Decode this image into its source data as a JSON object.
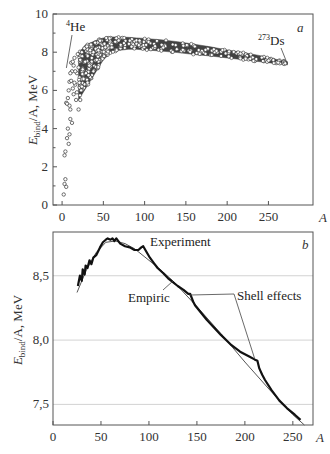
{
  "chart_data": [
    {
      "panel": "a",
      "type": "scatter",
      "xlabel": "A",
      "ylabel_main": "E",
      "ylabel_sub": "bind",
      "ylabel_rest": "/A, MeV",
      "xlim": [
        -11,
        304
      ],
      "ylim": [
        0,
        10
      ],
      "xticks": [
        0,
        50,
        100,
        150,
        200,
        250
      ],
      "xtick_labels": [
        "0",
        "50",
        "100",
        "150",
        "200",
        "250"
      ],
      "yticks": [
        0,
        2,
        4,
        6,
        8,
        10
      ],
      "ytick_labels": [
        "0",
        "2",
        "4",
        "6",
        "8",
        "10"
      ],
      "yminor": [
        1,
        3,
        5,
        7,
        9
      ],
      "grid": false,
      "low_points": [
        {
          "x": 2,
          "y": 0.55
        },
        {
          "x": 3,
          "y": 1.1
        },
        {
          "x": 4,
          "y": 1.35
        },
        {
          "x": 5,
          "y": 0.95
        },
        {
          "x": 3,
          "y": 2.6
        },
        {
          "x": 4,
          "y": 2.8
        },
        {
          "x": 6,
          "y": 3.5
        },
        {
          "x": 7,
          "y": 4.0
        },
        {
          "x": 8,
          "y": 3.2
        },
        {
          "x": 9,
          "y": 3.7
        },
        {
          "x": 5,
          "y": 5.35
        },
        {
          "x": 6,
          "y": 5.3
        },
        {
          "x": 7,
          "y": 5.6
        },
        {
          "x": 9,
          "y": 6.45
        },
        {
          "x": 10,
          "y": 5.0
        },
        {
          "x": 11,
          "y": 6.5
        },
        {
          "x": 11,
          "y": 7.45
        },
        {
          "x": 12,
          "y": 7.0
        },
        {
          "x": 13,
          "y": 7.5
        },
        {
          "x": 14,
          "y": 7.3
        },
        {
          "x": 15,
          "y": 7.7
        },
        {
          "x": 10,
          "y": 4.5
        },
        {
          "x": 12,
          "y": 4.3
        },
        {
          "x": 13,
          "y": 6.1
        },
        {
          "x": 14,
          "y": 5.8
        },
        {
          "x": 16,
          "y": 6.3
        },
        {
          "x": 17,
          "y": 5.5
        },
        {
          "x": 18,
          "y": 6.9
        },
        {
          "x": 19,
          "y": 7.9
        },
        {
          "x": 20,
          "y": 7.2
        },
        {
          "x": 20,
          "y": 5.0
        },
        {
          "x": 21,
          "y": 6.4
        },
        {
          "x": 22,
          "y": 7.6
        },
        {
          "x": 23,
          "y": 6.0
        },
        {
          "x": 24,
          "y": 8.0
        },
        {
          "x": 25,
          "y": 7.1
        },
        {
          "x": 26,
          "y": 6.6
        },
        {
          "x": 27,
          "y": 8.2
        },
        {
          "x": 28,
          "y": 7.5
        },
        {
          "x": 29,
          "y": 6.9
        },
        {
          "x": 30,
          "y": 8.3
        },
        {
          "x": 31,
          "y": 7.8
        },
        {
          "x": 33,
          "y": 7.3
        },
        {
          "x": 35,
          "y": 8.4
        },
        {
          "x": 36,
          "y": 7.7
        },
        {
          "x": 38,
          "y": 8.0
        },
        {
          "x": 40,
          "y": 8.5
        },
        {
          "x": 42,
          "y": 7.6
        },
        {
          "x": 44,
          "y": 8.1
        },
        {
          "x": 46,
          "y": 8.6
        },
        {
          "x": 8,
          "y": 6.0
        },
        {
          "x": 9,
          "y": 5.2
        },
        {
          "x": 10,
          "y": 6.9
        },
        {
          "x": 15,
          "y": 6.4
        },
        {
          "x": 16,
          "y": 7.0
        },
        {
          "x": 18,
          "y": 5.9
        },
        {
          "x": 22,
          "y": 5.5
        },
        {
          "x": 24,
          "y": 6.2
        },
        {
          "x": 32,
          "y": 6.8
        },
        {
          "x": 34,
          "y": 8.1
        }
      ],
      "band": {
        "description": "dense cloud of nuclides",
        "A": [
          20,
          30,
          40,
          50,
          60,
          70,
          80,
          90,
          100,
          120,
          140,
          160,
          180,
          200,
          220,
          240,
          260,
          273
        ],
        "upper": [
          8.0,
          8.4,
          8.6,
          8.75,
          8.8,
          8.79,
          8.78,
          8.75,
          8.72,
          8.65,
          8.55,
          8.42,
          8.28,
          8.12,
          7.98,
          7.82,
          7.62,
          7.5
        ],
        "lower": [
          5.5,
          6.2,
          6.9,
          7.6,
          8.0,
          8.1,
          8.15,
          8.15,
          8.12,
          8.06,
          7.98,
          7.88,
          7.8,
          7.7,
          7.6,
          7.5,
          7.4,
          7.33
        ]
      },
      "annotations": [
        {
          "text_sup": "4",
          "text": "He",
          "point": {
            "x": 4,
            "y": 7.07
          }
        },
        {
          "text_sup": "273",
          "text": "Ds",
          "point": {
            "x": 273,
            "y": 7.33
          }
        }
      ]
    },
    {
      "panel": "b",
      "type": "line",
      "xlabel": "A",
      "ylabel_main": "E",
      "ylabel_sub": "bind",
      "ylabel_rest": "/A, MeV",
      "xlim": [
        0,
        271
      ],
      "ylim": [
        7.34,
        8.84
      ],
      "xticks": [
        0,
        50,
        100,
        150,
        200,
        250
      ],
      "xtick_labels": [
        "0",
        "50",
        "100",
        "150",
        "200",
        "250"
      ],
      "yticks": [
        7.5,
        8.0,
        8.5
      ],
      "ytick_labels": [
        "7,5",
        "8,0",
        "8,5"
      ],
      "grid": true,
      "series": [
        {
          "name": "Experiment",
          "x": [
            26,
            28,
            30,
            31,
            33,
            34,
            36,
            38,
            40,
            42,
            45,
            49,
            52,
            55,
            57,
            60,
            62,
            64,
            66,
            70,
            75,
            80,
            85,
            89,
            92,
            94,
            97,
            101,
            105,
            109,
            115,
            120,
            125,
            130,
            136,
            141,
            143,
            146,
            148,
            160,
            175,
            186,
            195,
            205,
            210,
            213,
            215,
            218,
            221,
            228,
            236,
            244,
            252,
            258
          ],
          "y": [
            8.42,
            8.5,
            8.46,
            8.55,
            8.51,
            8.58,
            8.56,
            8.62,
            8.59,
            8.64,
            8.66,
            8.72,
            8.76,
            8.78,
            8.79,
            8.78,
            8.79,
            8.77,
            8.79,
            8.75,
            8.73,
            8.72,
            8.7,
            8.7,
            8.72,
            8.73,
            8.69,
            8.64,
            8.6,
            8.56,
            8.52,
            8.48,
            8.45,
            8.42,
            8.39,
            8.36,
            8.36,
            8.3,
            8.27,
            8.16,
            8.04,
            7.96,
            7.91,
            7.87,
            7.85,
            7.84,
            7.78,
            7.73,
            7.69,
            7.61,
            7.53,
            7.47,
            7.42,
            7.38
          ]
        },
        {
          "name": "Empiric",
          "x": [
            25,
            35,
            45,
            55,
            65,
            75,
            85,
            95,
            110,
            125,
            150,
            175,
            200,
            225,
            250,
            262
          ],
          "y": [
            8.37,
            8.55,
            8.68,
            8.76,
            8.77,
            8.75,
            8.71,
            8.65,
            8.56,
            8.46,
            8.26,
            8.05,
            7.83,
            7.62,
            7.42,
            7.34
          ]
        }
      ],
      "annotations": [
        {
          "text": "Experiment"
        },
        {
          "text": "Empiric"
        },
        {
          "text": "Shell effects",
          "points": [
            {
              "x": 142,
              "y": 8.35
            },
            {
              "x": 210,
              "y": 7.86
            }
          ]
        }
      ]
    }
  ]
}
